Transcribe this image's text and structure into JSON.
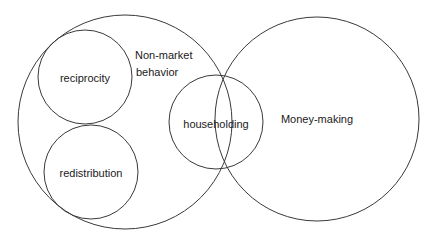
{
  "diagram": {
    "type": "venn",
    "circles": [
      {
        "id": "non-market-behavior",
        "cx": 125,
        "cy": 122,
        "r": 107
      },
      {
        "id": "reciprocity",
        "cx": 85,
        "cy": 77,
        "r": 47
      },
      {
        "id": "redistribution",
        "cx": 91,
        "cy": 172,
        "r": 47
      },
      {
        "id": "householding",
        "cx": 216,
        "cy": 122,
        "r": 47
      },
      {
        "id": "money-making",
        "cx": 317,
        "cy": 119,
        "r": 102
      }
    ],
    "labels": {
      "non_market_line1": "Non-market",
      "non_market_line2": "behavior",
      "reciprocity": "reciprocity",
      "redistribution": "redistribution",
      "householding": "householding",
      "money_making": "Money-making"
    },
    "colors": {
      "stroke": "#3a3a3a",
      "text": "#1a1a1a",
      "background": "#ffffff"
    }
  }
}
